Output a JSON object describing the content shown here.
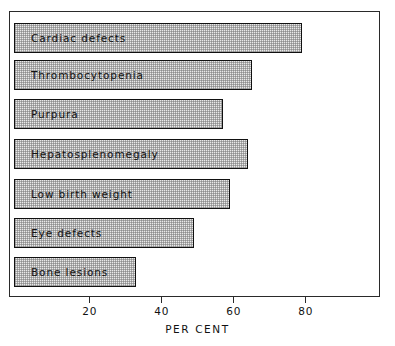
{
  "chart_data": {
    "type": "bar",
    "orientation": "horizontal",
    "title": "",
    "xlabel": "PER CENT",
    "ylabel": "",
    "xlim": [
      0,
      100
    ],
    "ylim": null,
    "grid": false,
    "legend": null,
    "xticks": [
      20,
      40,
      60,
      80
    ],
    "xtick_labels": [
      "20",
      "40",
      "60",
      "80"
    ],
    "categories": [
      "Cardiac defects",
      "Thrombocytopenia",
      "Purpura",
      "Hepatosplenomegaly",
      "Low birth weight",
      "Eye defects",
      "Bone lesions"
    ],
    "values": [
      80,
      66,
      58,
      65,
      60,
      50,
      34
    ],
    "series": [
      {
        "name": "Per cent",
        "values": [
          80,
          66,
          58,
          65,
          60,
          50,
          34
        ]
      }
    ],
    "bar_fill": "#e9e9e9",
    "bar_edge": "#111111",
    "frame_color": "#2a2a2a",
    "background": "#ffffff"
  },
  "axis": {
    "x_title": "PER CENT",
    "tick_labels": [
      "20",
      "40",
      "60",
      "80"
    ]
  },
  "bars": [
    {
      "label": "Cardiac defects",
      "value": 80
    },
    {
      "label": "Thrombocytopenia",
      "value": 66
    },
    {
      "label": "Purpura",
      "value": 58
    },
    {
      "label": "Hepatosplenomegaly",
      "value": 65
    },
    {
      "label": "Low birth weight",
      "value": 60
    },
    {
      "label": "Eye defects",
      "value": 50
    },
    {
      "label": "Bone lesions",
      "value": 34
    }
  ]
}
